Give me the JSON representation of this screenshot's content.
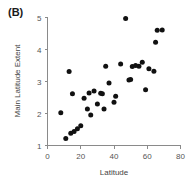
{
  "panel": {
    "label": "(B)"
  },
  "chart_data": {
    "type": "scatter",
    "title": "",
    "xlabel": "Latitude",
    "ylabel": "Main Latitude Extent",
    "xlim": [
      0,
      80
    ],
    "ylim": [
      1,
      5
    ],
    "xticks": [
      0,
      20,
      40,
      60,
      80
    ],
    "yticks": [
      1,
      2,
      3,
      4,
      5
    ],
    "grid": false,
    "legend": null,
    "marker": "filled-circle",
    "marker_color": "#111111",
    "points": [
      {
        "x": 8,
        "y": 2.02
      },
      {
        "x": 11,
        "y": 1.22
      },
      {
        "x": 13,
        "y": 3.31
      },
      {
        "x": 14,
        "y": 1.38
      },
      {
        "x": 15,
        "y": 2.62
      },
      {
        "x": 16,
        "y": 1.44
      },
      {
        "x": 18,
        "y": 1.52
      },
      {
        "x": 20,
        "y": 1.62
      },
      {
        "x": 22,
        "y": 2.48
      },
      {
        "x": 24,
        "y": 2.14
      },
      {
        "x": 25,
        "y": 2.64
      },
      {
        "x": 26,
        "y": 1.95
      },
      {
        "x": 28,
        "y": 2.7
      },
      {
        "x": 30,
        "y": 2.3
      },
      {
        "x": 32,
        "y": 2.63
      },
      {
        "x": 33,
        "y": 2.62
      },
      {
        "x": 34,
        "y": 2.14
      },
      {
        "x": 35,
        "y": 3.48
      },
      {
        "x": 37,
        "y": 2.95
      },
      {
        "x": 40,
        "y": 2.35
      },
      {
        "x": 41,
        "y": 2.54
      },
      {
        "x": 44,
        "y": 3.55
      },
      {
        "x": 47,
        "y": 4.97
      },
      {
        "x": 49,
        "y": 3.05
      },
      {
        "x": 50,
        "y": 3.06
      },
      {
        "x": 51,
        "y": 3.47
      },
      {
        "x": 53,
        "y": 3.5
      },
      {
        "x": 55,
        "y": 3.48
      },
      {
        "x": 57,
        "y": 3.6
      },
      {
        "x": 59,
        "y": 2.74
      },
      {
        "x": 61,
        "y": 3.4
      },
      {
        "x": 64,
        "y": 3.32
      },
      {
        "x": 65,
        "y": 4.23
      },
      {
        "x": 66,
        "y": 4.6
      },
      {
        "x": 69,
        "y": 4.61
      }
    ]
  }
}
